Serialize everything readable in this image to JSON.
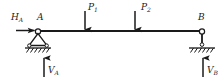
{
  "diagram": {
    "type": "free-body-diagram",
    "background_color": "#ffffff",
    "line_color": "#1a1a1a",
    "labels": {
      "horizontal_reaction_A": "H",
      "horizontal_reaction_A_sub": "A",
      "joint_A": "A",
      "load_1": "P",
      "load_1_sub": "1",
      "load_2": "P",
      "load_2_sub": "2",
      "joint_B": "B",
      "vertical_reaction_A": "V",
      "vertical_reaction_A_sub": "A",
      "vertical_reaction_B": "V",
      "vertical_reaction_B_sub": "B"
    },
    "geometry": {
      "beam_y": 31,
      "beam_x_start": 38,
      "beam_x_end": 202,
      "support_A_x": 38,
      "support_B_x": 202,
      "load_1_x": 85,
      "load_2_x": 135,
      "ground_y_A": 50,
      "ground_y_B": 50
    },
    "elements": [
      {
        "name": "beam-member",
        "kind": "horizontal-line"
      },
      {
        "name": "support-A",
        "kind": "pinned-triangle-support"
      },
      {
        "name": "support-B",
        "kind": "link-roller-support"
      },
      {
        "name": "load-arrow-P1",
        "kind": "downward-force-arrow"
      },
      {
        "name": "load-arrow-P2",
        "kind": "downward-force-arrow"
      },
      {
        "name": "reaction-arrow-HA",
        "kind": "rightward-force-arrow"
      },
      {
        "name": "reaction-arrow-VA",
        "kind": "upward-force-arrow"
      },
      {
        "name": "reaction-arrow-VB",
        "kind": "upward-force-arrow"
      },
      {
        "name": "ground-hatching-A",
        "kind": "hatched-ground"
      },
      {
        "name": "ground-hatching-B",
        "kind": "hatched-ground"
      }
    ]
  }
}
